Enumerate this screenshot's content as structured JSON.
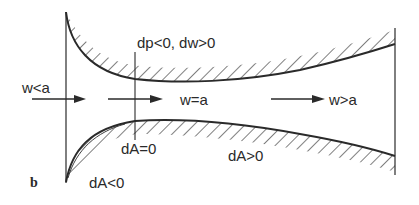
{
  "figure": {
    "panel_label": "b"
  },
  "labels": {
    "inlet_condition": "w<a",
    "throat_condition": "w=a",
    "outlet_condition": "w>a",
    "pressure_velocity": "dp<0, dw>0",
    "converging_area": "dA<0",
    "throat_area": "dA=0",
    "diverging_area": "dA>0"
  },
  "colors": {
    "stroke": "#2a2a2a",
    "hatch": "#3a3a3a",
    "background": "#ffffff"
  }
}
